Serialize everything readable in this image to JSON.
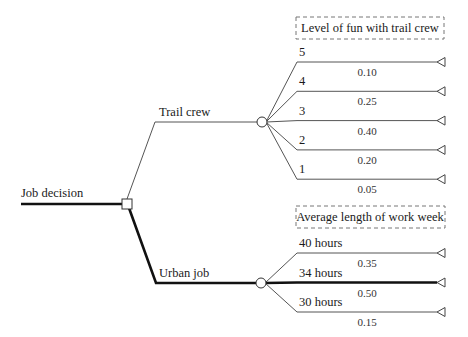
{
  "diagram": {
    "type": "decision-tree",
    "root": {
      "label": "Job decision",
      "node_type": "decision",
      "options": [
        {
          "label": "Trail crew",
          "chosen": false,
          "chance_node": {
            "header": "Level of fun with trail crew",
            "outcomes": [
              {
                "label": "5",
                "probability": "0.10"
              },
              {
                "label": "4",
                "probability": "0.25"
              },
              {
                "label": "3",
                "probability": "0.40"
              },
              {
                "label": "2",
                "probability": "0.20"
              },
              {
                "label": "1",
                "probability": "0.05"
              }
            ]
          }
        },
        {
          "label": "Urban job",
          "chosen": true,
          "chance_node": {
            "header": "Average length of work week",
            "outcomes": [
              {
                "label": "40 hours",
                "probability": "0.35",
                "highlighted": false
              },
              {
                "label": "34 hours",
                "probability": "0.50",
                "highlighted": true
              },
              {
                "label": "30 hours",
                "probability": "0.15",
                "highlighted": false
              }
            ]
          }
        }
      ]
    }
  }
}
